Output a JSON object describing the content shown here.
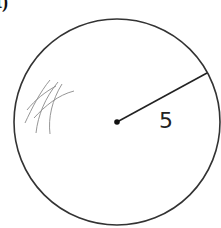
{
  "part_label": "t)",
  "circle": {
    "center": [
      117,
      122
    ],
    "radius_px": 103,
    "radius_value": "5",
    "stroke": "#333333"
  },
  "radius_line": {
    "from": [
      117,
      122
    ],
    "to": [
      207,
      73
    ]
  },
  "scribble": {
    "color": "#8a8a8a"
  }
}
